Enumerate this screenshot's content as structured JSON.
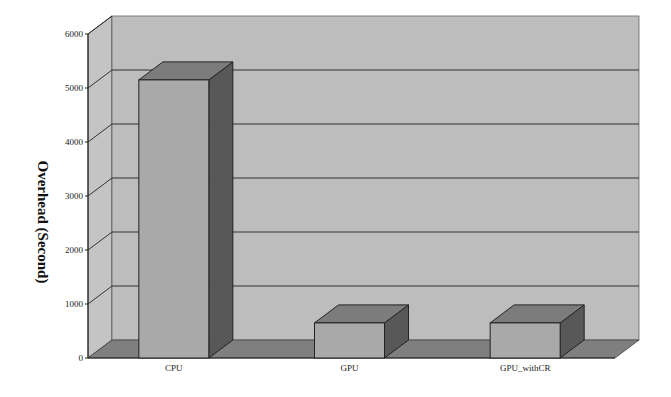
{
  "chart_data": {
    "type": "bar",
    "style": "3d-column",
    "title": "",
    "xlabel": "",
    "ylabel": "Overhead (Second)",
    "ylim": [
      0,
      6000
    ],
    "yticks": [
      0,
      1000,
      2000,
      3000,
      4000,
      5000,
      6000
    ],
    "ytick_labels": [
      "0",
      "1000",
      "2000",
      "3000",
      "4000",
      "5000",
      "6000"
    ],
    "grid": true,
    "legend": null,
    "categories": [
      "CPU",
      "GPU",
      "GPU_withCR"
    ],
    "values": [
      5150,
      650,
      650
    ]
  },
  "colors": {
    "wall": "#bdbdbd",
    "side_wall": "#c4c4c4",
    "floor": "#7f7f7f",
    "gridline": "#333333",
    "bar_front": "#a9a9a9",
    "bar_top": "#7c7c7c",
    "bar_side": "#585858",
    "outline": "#222222"
  }
}
